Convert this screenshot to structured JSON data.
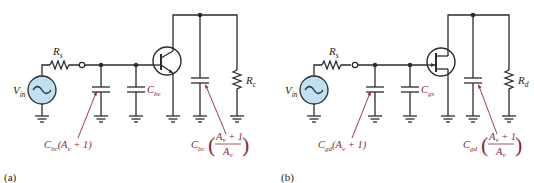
{
  "figure": {
    "panels": [
      {
        "id": "a",
        "panel_label": "(a)",
        "device": "BJT",
        "source_label": "V",
        "source_sub": "in",
        "series_resistor": "R",
        "series_resistor_sub": "s",
        "input_miller_cap": {
          "C": "C",
          "sub": "bc",
          "expr": "(A",
          "expr_sub": "v",
          "expr_tail": " + 1)"
        },
        "internal_cap": {
          "C": "C",
          "sub": "be"
        },
        "output_miller_cap": {
          "C": "C",
          "sub": "bc",
          "num": "A",
          "num_sub": "v",
          "num_tail": " + 1",
          "den": "A",
          "den_sub": "v"
        },
        "load_resistor": "R",
        "load_resistor_sub": "c"
      },
      {
        "id": "b",
        "panel_label": "(b)",
        "device": "FET",
        "source_label": "V",
        "source_sub": "in",
        "series_resistor": "R",
        "series_resistor_sub": "s",
        "input_miller_cap": {
          "C": "C",
          "sub": "gd",
          "expr": "(A",
          "expr_sub": "v",
          "expr_tail": " + 1)"
        },
        "internal_cap": {
          "C": "C",
          "sub": "gs"
        },
        "output_miller_cap": {
          "C": "C",
          "sub": "gd",
          "num": "A",
          "num_sub": "v",
          "num_tail": " + 1",
          "den": "A",
          "den_sub": "v"
        },
        "load_resistor": "R",
        "load_resistor_sub": "d"
      }
    ],
    "colors": {
      "wire": "#2b2b2b",
      "source_fill": "#bfe0f0",
      "annotation": "#8a2a3a"
    }
  }
}
